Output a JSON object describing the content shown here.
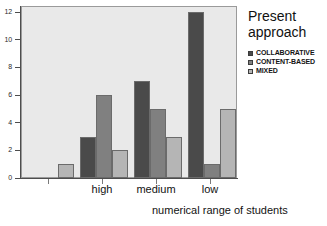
{
  "chart_data": {
    "type": "bar",
    "title": "",
    "xlabel": "numerical range of students",
    "ylabel": "",
    "categories": [
      "",
      "high",
      "medium",
      "low"
    ],
    "series": [
      {
        "name": "COLLABORATIVE",
        "color": "#4a4a4a",
        "values": [
          0,
          3,
          7,
          12
        ]
      },
      {
        "name": "CONTENT-BASED",
        "color": "#808080",
        "values": [
          0,
          6,
          5,
          1
        ]
      },
      {
        "name": "MIXED",
        "color": "#b5b5b5",
        "values": [
          1,
          2,
          3,
          5
        ]
      }
    ],
    "ylim": [
      0,
      12
    ],
    "yticks": [
      0,
      2,
      4,
      6,
      8,
      10,
      12
    ],
    "ytick_labels": [
      "0",
      "2",
      "4",
      "6",
      "8",
      "10",
      "12"
    ],
    "grid": false,
    "legend_position": "right",
    "legend_title": "Present approach",
    "plot_background": "#e9e9e9",
    "figure_background": "#ffffff"
  },
  "legend": {
    "title": "Present approach"
  },
  "axes": {
    "x_title": "numerical range of students"
  }
}
